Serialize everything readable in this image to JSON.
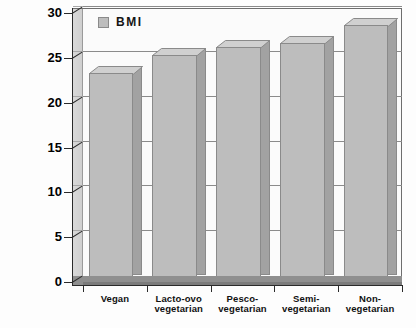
{
  "chart_data": {
    "type": "bar",
    "title": "",
    "subtitle": "",
    "xlabel": "",
    "ylabel": "",
    "categories": [
      "Vegan",
      "Lacto-ovo\nvegetarian",
      "Pesco-\nvegetarian",
      "Semi-\nvegetarian",
      "Non-\nvegetarian"
    ],
    "category_lines": [
      [
        "Vegan"
      ],
      [
        "Lacto-ovo",
        "vegetarian"
      ],
      [
        "Pesco-",
        "vegetarian"
      ],
      [
        "Semi-",
        "vegetarian"
      ],
      [
        "Non-",
        "vegetarian"
      ]
    ],
    "series": [
      {
        "name": "BMI",
        "values": [
          23.3,
          25.3,
          26.2,
          26.6,
          28.7
        ],
        "color": "#bdbdbd"
      }
    ],
    "ylim": [
      0,
      30
    ],
    "ytick_values": [
      0,
      5,
      10,
      15,
      20,
      25,
      30
    ],
    "ytick_labels": [
      "0",
      "5",
      "10",
      "15",
      "20",
      "25",
      "30"
    ],
    "grid": true,
    "grid_axis": "y",
    "legend": {
      "position": "top-left",
      "entries": [
        {
          "label": "BMI",
          "swatch_color": "#bdbdbd"
        }
      ]
    },
    "style": {
      "three_d": true,
      "plot_background": "#fbfbfb",
      "frame_color": "#6e6e6e",
      "axis_color": "#2a2a2a",
      "gridline_color": "#8b8b8b",
      "bar_face_color": "#bdbdbd",
      "bar_side_color": "#a2a2a2",
      "bar_top_color": "#d0d0d0",
      "bar_edge_color": "#8a8a8a",
      "floor_color": "#8f8f8f",
      "wall_color": "#d4d4d4"
    }
  },
  "legend": {
    "bmi_label": "BMI"
  },
  "axes": {
    "y": {
      "t0": "0",
      "t1": "5",
      "t2": "10",
      "t3": "15",
      "t4": "20",
      "t5": "25",
      "t6": "30"
    },
    "x": {
      "c0_l0": "Vegan",
      "c1_l0": "Lacto-ovo",
      "c1_l1": "vegetarian",
      "c2_l0": "Pesco-",
      "c2_l1": "vegetarian",
      "c3_l0": "Semi-",
      "c3_l1": "vegetarian",
      "c4_l0": "Non-",
      "c4_l1": "vegetarian"
    }
  }
}
